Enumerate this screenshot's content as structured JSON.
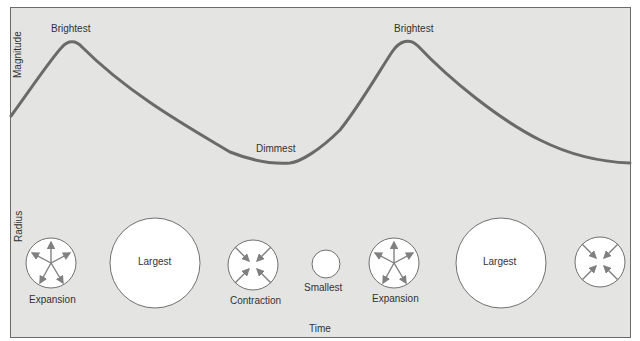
{
  "axes": {
    "y_top_label": "Magnitude",
    "y_bottom_label": "Radius",
    "x_label": "Time"
  },
  "curve_labels": {
    "peak1": "Brightest",
    "trough": "Dimmest",
    "peak2": "Brightest"
  },
  "circles": [
    {
      "label": "Expansion",
      "state": "expansion",
      "radius": 25
    },
    {
      "label": "Largest",
      "state": "largest",
      "radius": 45
    },
    {
      "label": "Contraction",
      "state": "contraction",
      "radius": 25
    },
    {
      "label": "Smallest",
      "state": "smallest",
      "radius": 14
    },
    {
      "label": "Expansion",
      "state": "expansion",
      "radius": 25
    },
    {
      "label": "Largest",
      "state": "largest",
      "radius": 45
    },
    {
      "label": "",
      "state": "contraction",
      "radius": 25
    }
  ],
  "colors": {
    "background": "#e4e4e2",
    "curve": "#6a6a6a",
    "arrow": "#808080",
    "circle_fill": "#ffffff",
    "circle_stroke": "#707070"
  }
}
